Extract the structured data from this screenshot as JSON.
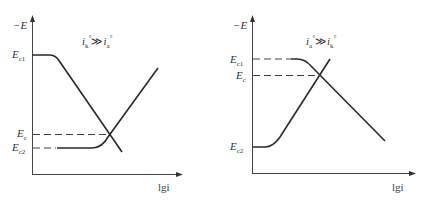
{
  "diagrams": [
    {
      "id": "left",
      "y_axis_label": "−E",
      "x_axis_label": "lgi",
      "condition": {
        "lhs": "i",
        "lhs_sub": "k",
        "op": "≫",
        "rhs": "i",
        "rhs_sub": "a",
        "sup": "°"
      },
      "levels": [
        {
          "name": "E",
          "sub": "c1"
        },
        {
          "name": "E",
          "sub": "c"
        },
        {
          "name": "E",
          "sub": "c2"
        }
      ]
    },
    {
      "id": "right",
      "y_axis_label": "−E",
      "x_axis_label": "lgi",
      "condition": {
        "lhs": "i",
        "lhs_sub": "a",
        "op": "≫",
        "rhs": "i",
        "rhs_sub": "k",
        "sup": "°"
      },
      "levels": [
        {
          "name": "E",
          "sub": "c1"
        },
        {
          "name": "E",
          "sub": "c"
        },
        {
          "name": "E",
          "sub": "c2"
        }
      ]
    }
  ],
  "colors": {
    "line": "#2a2a2a",
    "axis": "#444444",
    "dash": "#444444"
  }
}
